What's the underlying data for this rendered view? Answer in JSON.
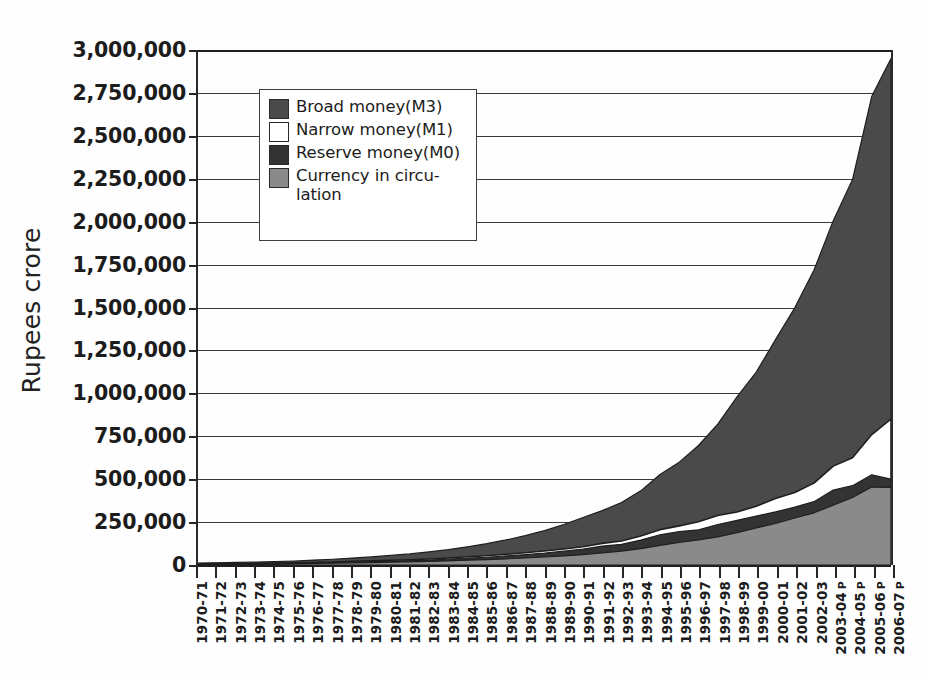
{
  "figure": {
    "scan_artifact_text": "",
    "background_color": "#ffffff"
  },
  "axes": {
    "ylabel": "Rupees crore",
    "yticks": [
      "3,000,000",
      "2,750,000",
      "2,500,000",
      "2,250,000",
      "2,000,000",
      "1,750,000",
      "1,500,000",
      "1,250,000",
      "1,000,000",
      "750,000",
      "500,000",
      "250,000",
      "0"
    ]
  },
  "legend": {
    "items": [
      {
        "label": "Broad money(M3)",
        "color": "#4a4a4a",
        "name": "broad-money-m3"
      },
      {
        "label": "Narrow money(M1)",
        "color": "#ffffff",
        "name": "narrow-money-m1"
      },
      {
        "label": "Reserve money(M0)",
        "color": "#333333",
        "name": "reserve-money-m0"
      },
      {
        "label": "Currency in circu-\nlation",
        "color": "#8a8a8a",
        "name": "currency-in-circulation"
      }
    ]
  },
  "chart_data": {
    "type": "area",
    "title": "",
    "subtitle": "",
    "xlabel": "",
    "ylabel": "Rupees crore",
    "ylim": [
      0,
      3000000
    ],
    "ytick_step": 250000,
    "grid": true,
    "legend_position": "upper-left-inside",
    "overlay_style": "layered (not stacked) — each series drawn from zero, largest behind",
    "categories": [
      "1970-71",
      "1971-72",
      "1972-73",
      "1973-74",
      "1974-75",
      "1975-76",
      "1976-77",
      "1977-78",
      "1978-79",
      "1979-80",
      "1980-81",
      "1981-82",
      "1982-83",
      "1983-84",
      "1984-85",
      "1985-86",
      "1986-87",
      "1987-88",
      "1988-89",
      "1989-90",
      "1990-91",
      "1991-92",
      "1992-93",
      "1993-94",
      "1994-95",
      "1995-96",
      "1996-97",
      "1997-98",
      "1998-99",
      "1999-00",
      "2000-01",
      "2001-02",
      "2002-03",
      "2003-04",
      "2004-05",
      "2005-06",
      "2006-07"
    ],
    "category_suffix_provisional": [
      "2003-04",
      "2004-05",
      "2005-06",
      "2006-07"
    ],
    "provisional_marker": "P",
    "series": [
      {
        "name": "Broad money(M3)",
        "color": "#4a4a4a",
        "values": [
          11020,
          12800,
          14900,
          17600,
          19900,
          23200,
          28400,
          33600,
          40400,
          47100,
          55800,
          64400,
          76000,
          89500,
          106000,
          124000,
          146000,
          171000,
          200000,
          236000,
          277000,
          317000,
          364000,
          432000,
          527000,
          599000,
          696000,
          821000,
          980000,
          1124000,
          1313000,
          1498000,
          1718000,
          2005000,
          2245000,
          2730000,
          2950000
        ]
      },
      {
        "name": "Narrow money(M1)",
        "color": "#ffffff",
        "values": [
          6950,
          7800,
          8900,
          10200,
          11100,
          12200,
          14900,
          17500,
          21000,
          24000,
          27900,
          30600,
          35200,
          40900,
          47800,
          54000,
          62600,
          71500,
          81800,
          92900,
          106000,
          126000,
          140000,
          169000,
          206000,
          228000,
          252000,
          288000,
          309000,
          342000,
          387000,
          422000,
          477000,
          576000,
          625000,
          760000,
          850000
        ]
      },
      {
        "name": "Reserve money(M0)",
        "color": "#333333",
        "values": [
          5400,
          6100,
          7000,
          8100,
          8900,
          9600,
          11800,
          14200,
          17300,
          19700,
          22900,
          25200,
          28900,
          33900,
          40300,
          45100,
          52600,
          60200,
          68900,
          80500,
          92000,
          110000,
          120000,
          145000,
          176000,
          195000,
          205000,
          236000,
          260000,
          285000,
          309000,
          337000,
          369000,
          437000,
          462000,
          525000,
          500000
        ]
      },
      {
        "name": "Currency in circulation",
        "color": "#8a8a8a",
        "values": [
          4400,
          4900,
          5600,
          6400,
          7000,
          7500,
          8900,
          10400,
          12500,
          14400,
          16700,
          18300,
          20700,
          23900,
          28000,
          31200,
          35800,
          40900,
          46600,
          53100,
          61000,
          71000,
          81000,
          95000,
          114000,
          131000,
          146000,
          164000,
          188000,
          216000,
          242000,
          274000,
          304000,
          348000,
          393000,
          454000,
          452000
        ]
      }
    ]
  }
}
